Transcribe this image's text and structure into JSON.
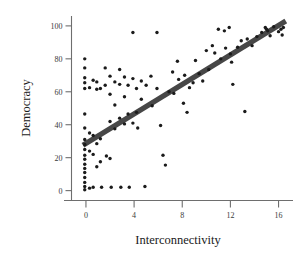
{
  "chart_data": {
    "type": "scatter",
    "title": "",
    "xlabel": "Interconnectivity",
    "ylabel": "Democracy",
    "xlim": [
      -1.2,
      17.2
    ],
    "ylim": [
      -6,
      106
    ],
    "xticks": [
      0,
      4,
      8,
      12,
      16
    ],
    "yticks": [
      0,
      20,
      40,
      60,
      80,
      100
    ],
    "grid": false,
    "legend": null,
    "series": [
      {
        "name": "countries",
        "marker": "filled-circle",
        "color": "#1b1b1b",
        "points": [
          [
            -0.1,
            80.0
          ],
          [
            -0.1,
            74.5
          ],
          [
            -0.1,
            68.5
          ],
          [
            -0.1,
            65.5
          ],
          [
            -0.1,
            62.0
          ],
          [
            -0.1,
            46.5
          ],
          [
            -0.1,
            38.0
          ],
          [
            -0.1,
            31.0
          ],
          [
            -0.1,
            28.0
          ],
          [
            -0.1,
            25.0
          ],
          [
            -0.1,
            21.5
          ],
          [
            -0.1,
            19.0
          ],
          [
            -0.1,
            16.0
          ],
          [
            -0.1,
            13.5
          ],
          [
            -0.1,
            11.0
          ],
          [
            -0.1,
            8.0
          ],
          [
            -0.1,
            5.0
          ],
          [
            -0.1,
            2.5
          ],
          [
            -0.1,
            0.5
          ],
          [
            0.3,
            62.5
          ],
          [
            0.3,
            35.0
          ],
          [
            0.3,
            24.0
          ],
          [
            0.3,
            1.5
          ],
          [
            0.6,
            67.0
          ],
          [
            0.6,
            33.5
          ],
          [
            0.6,
            22.0
          ],
          [
            0.6,
            2.0
          ],
          [
            0.9,
            66.0
          ],
          [
            0.9,
            61.5
          ],
          [
            0.9,
            28.5
          ],
          [
            0.9,
            14.5
          ],
          [
            1.2,
            62.0
          ],
          [
            1.2,
            31.5
          ],
          [
            1.2,
            17.5
          ],
          [
            1.3,
            2.0
          ],
          [
            1.6,
            74.5
          ],
          [
            1.6,
            64.0
          ],
          [
            1.7,
            21.0
          ],
          [
            2.0,
            69.5
          ],
          [
            2.0,
            58.5
          ],
          [
            2.0,
            42.0
          ],
          [
            2.0,
            19.5
          ],
          [
            2.1,
            2.0
          ],
          [
            2.4,
            66.0
          ],
          [
            2.4,
            52.0
          ],
          [
            2.4,
            37.5
          ],
          [
            2.8,
            73.5
          ],
          [
            2.8,
            64.5
          ],
          [
            2.8,
            44.0
          ],
          [
            2.9,
            2.0
          ],
          [
            3.2,
            69.0
          ],
          [
            3.2,
            57.0
          ],
          [
            3.2,
            40.5
          ],
          [
            3.5,
            64.0
          ],
          [
            3.5,
            46.5
          ],
          [
            3.6,
            2.0
          ],
          [
            3.9,
            96.0
          ],
          [
            3.9,
            68.0
          ],
          [
            3.9,
            41.0
          ],
          [
            4.2,
            62.0
          ],
          [
            4.2,
            47.5
          ],
          [
            4.3,
            38.0
          ],
          [
            4.6,
            66.5
          ],
          [
            4.6,
            55.5
          ],
          [
            4.9,
            2.5
          ],
          [
            5.0,
            64.0
          ],
          [
            5.4,
            69.5
          ],
          [
            5.5,
            51.5
          ],
          [
            5.9,
            96.0
          ],
          [
            5.9,
            62.0
          ],
          [
            6.2,
            39.5
          ],
          [
            6.4,
            21.5
          ],
          [
            6.6,
            15.5
          ],
          [
            6.9,
            60.0
          ],
          [
            7.2,
            72.0
          ],
          [
            7.3,
            59.0
          ],
          [
            7.6,
            78.5
          ],
          [
            7.7,
            67.5
          ],
          [
            8.1,
            53.0
          ],
          [
            8.2,
            70.0
          ],
          [
            8.4,
            47.5
          ],
          [
            8.6,
            62.5
          ],
          [
            8.9,
            65.5
          ],
          [
            9.1,
            79.0
          ],
          [
            9.4,
            71.0
          ],
          [
            9.7,
            66.5
          ],
          [
            10.0,
            85.0
          ],
          [
            10.2,
            73.5
          ],
          [
            10.5,
            88.0
          ],
          [
            10.7,
            83.5
          ],
          [
            11.0,
            98.0
          ],
          [
            11.2,
            80.0
          ],
          [
            11.5,
            97.0
          ],
          [
            11.6,
            86.5
          ],
          [
            11.9,
            99.0
          ],
          [
            12.0,
            83.0
          ],
          [
            12.1,
            78.0
          ],
          [
            12.2,
            64.5
          ],
          [
            12.6,
            87.0
          ],
          [
            12.9,
            91.0
          ],
          [
            13.2,
            48.0
          ],
          [
            13.4,
            92.0
          ],
          [
            13.8,
            88.0
          ],
          [
            14.2,
            93.5
          ],
          [
            14.6,
            96.0
          ],
          [
            14.9,
            99.0
          ],
          [
            15.0,
            98.0
          ],
          [
            15.1,
            97.0
          ],
          [
            15.3,
            94.0
          ],
          [
            15.6,
            99.5
          ],
          [
            16.0,
            96.5
          ],
          [
            16.2,
            98.0
          ],
          [
            16.3,
            94.5
          ],
          [
            16.4,
            99.0
          ]
        ]
      }
    ],
    "fit_line": {
      "name": "linear-fit",
      "color": "#474747",
      "x_start": -0.25,
      "y_start": 27.5,
      "x_end": 16.6,
      "y_end": 103.0
    }
  }
}
